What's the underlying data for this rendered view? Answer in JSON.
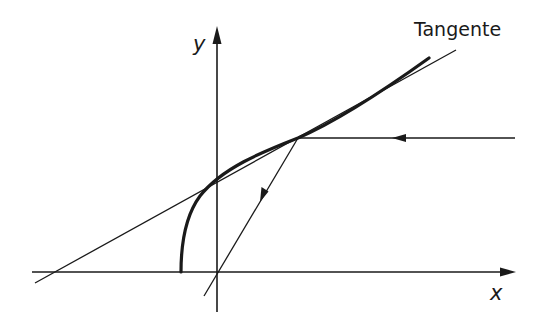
{
  "diagram": {
    "labels": {
      "tangent": "Tangente",
      "y_axis": "y",
      "x_axis": "x"
    },
    "colors": {
      "line": "#1a1a1a",
      "background": "#ffffff"
    },
    "elements": [
      {
        "id": "x-axis",
        "type": "arrow-line",
        "from": [
          32,
          272
        ],
        "to": [
          516,
          272
        ]
      },
      {
        "id": "y-axis",
        "type": "arrow-line",
        "from": [
          217,
          312
        ],
        "to": [
          217,
          26
        ]
      },
      {
        "id": "tangent-line",
        "type": "line",
        "from": [
          35,
          283
        ],
        "to": [
          456,
          50
        ]
      },
      {
        "id": "parabola-curve",
        "type": "curve",
        "vertex": [
          181,
          272
        ],
        "passes_through": [
          298,
          138
        ],
        "end": [
          429,
          58
        ]
      },
      {
        "id": "incident-ray",
        "type": "ray",
        "from": [
          515,
          138
        ],
        "to": [
          298,
          138
        ],
        "arrow_at": [
          400,
          138
        ],
        "direction": "left"
      },
      {
        "id": "reflected-ray",
        "type": "ray",
        "from": [
          298,
          138
        ],
        "to": [
          204,
          296
        ],
        "arrow_at": [
          263,
          196
        ],
        "direction": "down-left"
      }
    ]
  }
}
